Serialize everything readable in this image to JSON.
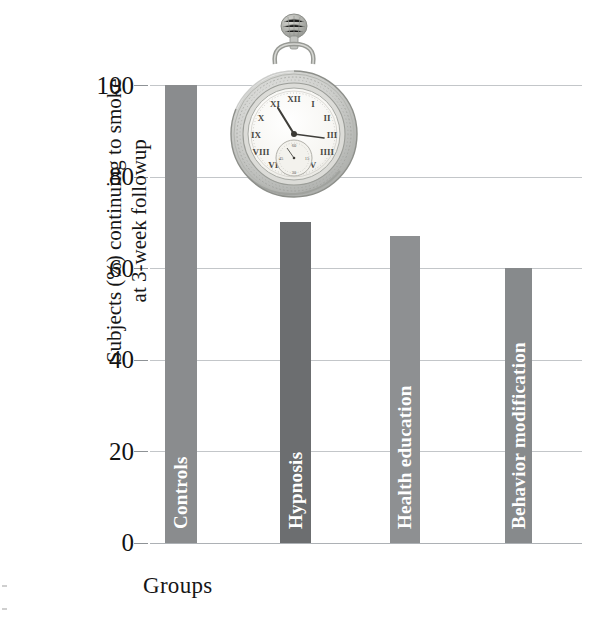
{
  "chart_data": {
    "type": "bar",
    "title": "",
    "subtitle": "",
    "xlabel": "Groups",
    "ylabel_line1": "Subjects (%) continuing to smoke",
    "ylabel_line2": "at 3-week followup",
    "categories": [
      "Controls",
      "Hypnosis",
      "Health education",
      "Behavior modification"
    ],
    "values": [
      100,
      70,
      67,
      60
    ],
    "ylim": [
      0,
      100
    ],
    "yticks": [
      0,
      20,
      40,
      60,
      80,
      100
    ],
    "ytick_labels": [
      "0",
      "20",
      "40",
      "60",
      "80",
      "100"
    ],
    "grid": true,
    "grid_axis": "y",
    "legend": false,
    "bar_colors": [
      "#8a8c8e",
      "#6c6e70",
      "#8e9092",
      "#878a8c"
    ],
    "bar_label_color": "#ffffff",
    "grid_color": "#b9bcc0",
    "annotations": [
      {
        "name": "pocket-watch-illustration",
        "description": "Vintage open-face pocket watch with Roman numerals and seconds sub-dial",
        "x_center_pct": 48.6,
        "y_value_approx": 100
      }
    ]
  },
  "figure": {
    "axis_title_x": "Groups",
    "axis_title_y_lines": [
      "Subjects (%) continuing to smoke",
      "at 3-week followup"
    ],
    "watch_icon_name": "pocket-watch-icon"
  }
}
